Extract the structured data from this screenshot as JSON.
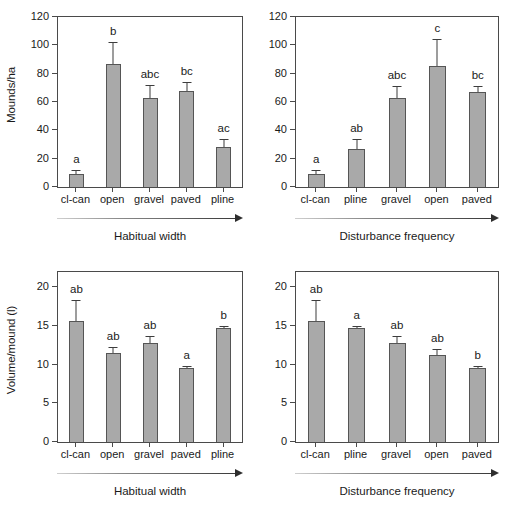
{
  "figure": {
    "bar_color": "#a9a9a9",
    "bar_edge_color": "#555555",
    "axis_color": "#4a4a4a"
  },
  "chart_data": [
    {
      "id": "mounds-habitual-width",
      "type": "bar",
      "title": "",
      "xlabel": "Habitual width",
      "ylabel": "Mounds/ha",
      "ylim": [
        0,
        120
      ],
      "yticks": [
        0,
        20,
        40,
        60,
        80,
        100,
        120
      ],
      "grid": false,
      "legend": "none",
      "categories": [
        "cl-can",
        "open",
        "gravel",
        "paved",
        "pline"
      ],
      "values": [
        9,
        86.5,
        63,
        68,
        28
      ],
      "errors": [
        3,
        16,
        9,
        6,
        6
      ],
      "annotations": [
        "a",
        "b",
        "abc",
        "bc",
        "ac"
      ]
    },
    {
      "id": "mounds-disturbance-frequency",
      "type": "bar",
      "title": "",
      "xlabel": "Disturbance frequency",
      "ylabel": "",
      "ylim": [
        0,
        120
      ],
      "yticks": [
        0,
        20,
        40,
        60,
        80,
        100,
        120
      ],
      "grid": false,
      "legend": "none",
      "categories": [
        "cl-can",
        "pline",
        "gravel",
        "open",
        "paved"
      ],
      "values": [
        9,
        27,
        63,
        85.5,
        67
      ],
      "errors": [
        3,
        7,
        8,
        19,
        4
      ],
      "annotations": [
        "a",
        "ab",
        "abc",
        "c",
        "bc"
      ]
    },
    {
      "id": "volume-habitual-width",
      "type": "bar",
      "title": "",
      "xlabel": "Habitual width",
      "ylabel": "Volume/mound (l)",
      "ylim": [
        0,
        22
      ],
      "yticks": [
        0,
        5,
        10,
        15,
        20
      ],
      "grid": false,
      "legend": "none",
      "categories": [
        "cl-can",
        "open",
        "gravel",
        "paved",
        "pline"
      ],
      "values": [
        15.6,
        11.5,
        12.8,
        9.6,
        14.7
      ],
      "errors": [
        2.8,
        0.8,
        0.9,
        0.3,
        0.3
      ],
      "annotations": [
        "ab",
        "ab",
        "ab",
        "a",
        "b"
      ]
    },
    {
      "id": "volume-disturbance-frequency",
      "type": "bar",
      "title": "",
      "xlabel": "Disturbance frequency",
      "ylabel": "",
      "ylim": [
        0,
        22
      ],
      "yticks": [
        0,
        5,
        10,
        15,
        20
      ],
      "grid": false,
      "legend": "none",
      "categories": [
        "cl-can",
        "pline",
        "gravel",
        "open",
        "paved"
      ],
      "values": [
        15.6,
        14.7,
        12.8,
        11.3,
        9.6
      ],
      "errors": [
        2.8,
        0.3,
        0.9,
        0.8,
        0.3
      ],
      "annotations": [
        "ab",
        "a",
        "ab",
        "ab",
        "b"
      ]
    }
  ]
}
